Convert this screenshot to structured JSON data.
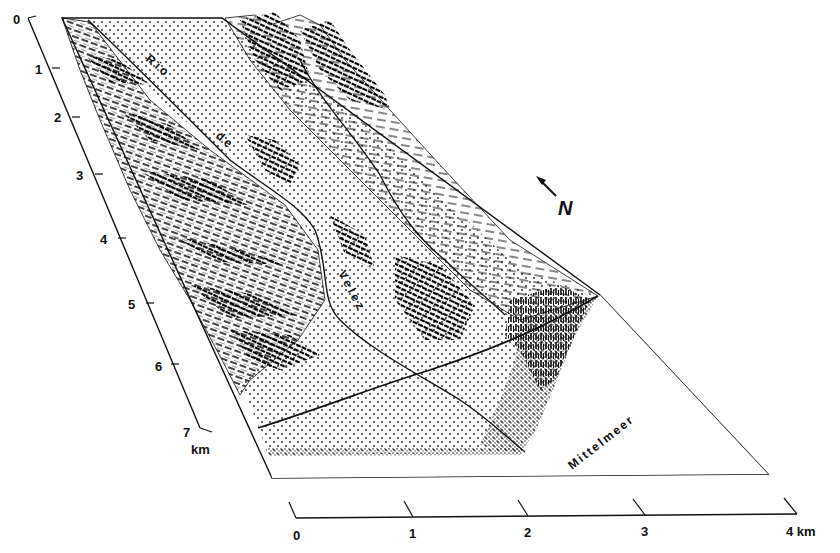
{
  "diagram": {
    "type": "block-diagram",
    "colors": {
      "ink": "#111111",
      "paper": "#ffffff",
      "stipple": "#222222"
    },
    "labels": {
      "river": [
        "Rio",
        "de",
        "Velez"
      ],
      "sea": "Mittelmeer",
      "north": "N"
    },
    "left_scale": {
      "ticks": [
        "0",
        "1",
        "2",
        "3",
        "4",
        "5",
        "6",
        "7"
      ],
      "unit": "km"
    },
    "bottom_scale": {
      "ticks": [
        "0",
        "1",
        "2",
        "3"
      ],
      "last_tick": "4 km"
    },
    "legend_hint": {
      "stipple": "alluvial plain / valley floor",
      "hachures": "mountain relief",
      "vertical-marks": "settlement (town) near coast",
      "white": "sea (Mittelmeer)"
    }
  }
}
